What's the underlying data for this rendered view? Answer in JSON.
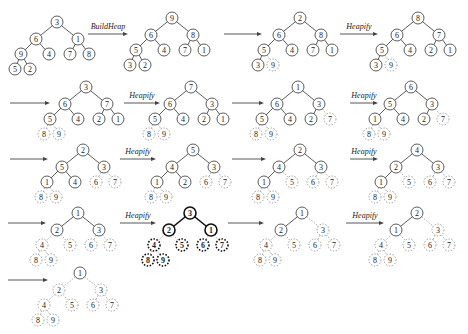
{
  "node_offsets": [
    [
      0,
      0
    ],
    [
      -21,
      17
    ],
    [
      21,
      17
    ],
    [
      -36,
      32
    ],
    [
      -8,
      32
    ],
    [
      13,
      32
    ],
    [
      32,
      32
    ],
    [
      -42,
      47
    ],
    [
      -27,
      47
    ]
  ],
  "edges": [
    [
      0,
      1
    ],
    [
      0,
      2
    ],
    [
      1,
      3
    ],
    [
      1,
      4
    ],
    [
      2,
      5
    ],
    [
      2,
      6
    ],
    [
      3,
      7
    ],
    [
      3,
      8
    ]
  ],
  "trees": [
    {
      "id": "t1",
      "root": [
        57,
        22
      ],
      "values": [
        3,
        6,
        1,
        9,
        4,
        7,
        8,
        5,
        2
      ],
      "sorted": [],
      "style": "normal"
    },
    {
      "id": "t2",
      "root": [
        172,
        18
      ],
      "values": [
        9,
        6,
        8,
        5,
        4,
        7,
        1,
        3,
        2
      ],
      "sorted": [],
      "style": "normal"
    },
    {
      "id": "t3",
      "root": [
        300,
        18
      ],
      "values": [
        2,
        6,
        8,
        5,
        4,
        7,
        1,
        3,
        9
      ],
      "sorted": [
        8
      ],
      "style": "normal"
    },
    {
      "id": "t4",
      "root": [
        418,
        18
      ],
      "values": [
        8,
        6,
        7,
        5,
        4,
        2,
        1,
        3,
        9
      ],
      "sorted": [
        8
      ],
      "style": "normal"
    },
    {
      "id": "t5",
      "root": [
        86,
        87
      ],
      "values": [
        3,
        6,
        7,
        5,
        4,
        2,
        1,
        8,
        9
      ],
      "sorted": [
        7,
        8
      ],
      "style": "normal"
    },
    {
      "id": "t6",
      "root": [
        191,
        87
      ],
      "values": [
        7,
        6,
        3,
        5,
        4,
        2,
        1,
        8,
        9
      ],
      "sorted": [
        7,
        8
      ],
      "style": "normal"
    },
    {
      "id": "t7",
      "root": [
        298,
        87
      ],
      "values": [
        1,
        6,
        3,
        5,
        4,
        2,
        7,
        8,
        9
      ],
      "sorted": [
        6,
        7,
        8
      ],
      "style": "normal"
    },
    {
      "id": "t8",
      "root": [
        411,
        87
      ],
      "values": [
        6,
        5,
        3,
        1,
        4,
        2,
        7,
        8,
        9
      ],
      "sorted": [
        6,
        7,
        8
      ],
      "style": "normal"
    },
    {
      "id": "t9",
      "root": [
        83,
        150
      ],
      "values": [
        2,
        5,
        3,
        1,
        4,
        6,
        7,
        8,
        9
      ],
      "sorted": [
        5,
        6,
        7,
        8
      ],
      "style": "normal"
    },
    {
      "id": "t10",
      "root": [
        193,
        150
      ],
      "values": [
        5,
        4,
        3,
        1,
        2,
        6,
        7,
        8,
        9
      ],
      "sorted": [
        5,
        6,
        7,
        8
      ],
      "style": "normal"
    },
    {
      "id": "t11",
      "root": [
        300,
        150
      ],
      "values": [
        2,
        4,
        3,
        1,
        5,
        6,
        7,
        8,
        9
      ],
      "sorted": [
        4,
        5,
        6,
        7,
        8
      ],
      "style": "normal"
    },
    {
      "id": "t12",
      "root": [
        417,
        150
      ],
      "values": [
        4,
        2,
        3,
        1,
        5,
        6,
        7,
        8,
        9
      ],
      "sorted": [
        4,
        5,
        6,
        7,
        8
      ],
      "style": "normal"
    },
    {
      "id": "t13",
      "root": [
        78,
        213
      ],
      "values": [
        1,
        2,
        3,
        4,
        5,
        6,
        7,
        8,
        9
      ],
      "sorted": [
        3,
        4,
        5,
        6,
        7,
        8
      ],
      "style": "normal"
    },
    {
      "id": "t14",
      "root": [
        190,
        213
      ],
      "values": [
        3,
        2,
        1,
        4,
        5,
        6,
        7,
        8,
        9
      ],
      "sorted": [
        3,
        4,
        5,
        6,
        7,
        8
      ],
      "style": "bold"
    },
    {
      "id": "t15",
      "root": [
        302,
        213
      ],
      "values": [
        1,
        2,
        3,
        4,
        5,
        6,
        7,
        8,
        9
      ],
      "sorted": [
        2,
        3,
        4,
        5,
        6,
        7,
        8
      ],
      "style": "normal"
    },
    {
      "id": "t16",
      "root": [
        417,
        213
      ],
      "values": [
        2,
        1,
        3,
        4,
        5,
        6,
        7,
        8,
        9
      ],
      "sorted": [
        2,
        3,
        4,
        5,
        6,
        7,
        8
      ],
      "style": "normal"
    },
    {
      "id": "t17",
      "root": [
        80,
        273
      ],
      "values": [
        1,
        2,
        3,
        4,
        5,
        6,
        7,
        8,
        9
      ],
      "sorted": [
        1,
        2,
        3,
        4,
        5,
        6,
        7,
        8
      ],
      "style": "normal"
    }
  ],
  "arrows": [
    {
      "x1": 88,
      "x2": 128,
      "y": 34,
      "label": "BuildHeap"
    },
    {
      "x1": 224,
      "x2": 262,
      "y": 34,
      "label": ""
    },
    {
      "x1": 340,
      "x2": 378,
      "y": 34,
      "label": "Heapify"
    },
    {
      "x1": 10,
      "x2": 50,
      "y": 103,
      "label": ""
    },
    {
      "x1": 124,
      "x2": 160,
      "y": 103,
      "label": "Heapify"
    },
    {
      "x1": 232,
      "x2": 264,
      "y": 103,
      "label": ""
    },
    {
      "x1": 350,
      "x2": 378,
      "y": 103,
      "label": "Heapify"
    },
    {
      "x1": 10,
      "x2": 48,
      "y": 159,
      "label": ""
    },
    {
      "x1": 120,
      "x2": 156,
      "y": 159,
      "label": "Heapify"
    },
    {
      "x1": 232,
      "x2": 266,
      "y": 159,
      "label": ""
    },
    {
      "x1": 350,
      "x2": 378,
      "y": 159,
      "label": "Heapify"
    },
    {
      "x1": 8,
      "x2": 46,
      "y": 223,
      "label": ""
    },
    {
      "x1": 120,
      "x2": 156,
      "y": 223,
      "label": "Heapify"
    },
    {
      "x1": 228,
      "x2": 264,
      "y": 223,
      "label": ""
    },
    {
      "x1": 346,
      "x2": 384,
      "y": 223,
      "label": "Heapify"
    },
    {
      "x1": 8,
      "x2": 48,
      "y": 280,
      "label": ""
    }
  ],
  "labels": {
    "build": "BuildHeap",
    "heapify": "Heapify"
  }
}
